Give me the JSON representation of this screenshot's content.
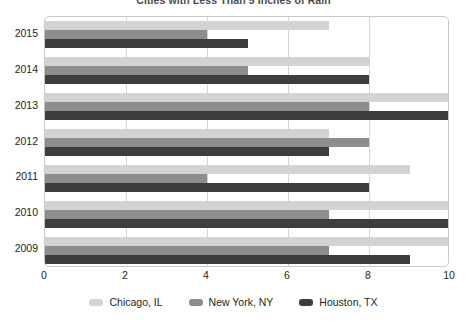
{
  "chart_data": {
    "type": "bar",
    "orientation": "horizontal",
    "title": "Cities with Less Than 5 Inches of Rain",
    "categories": [
      "2015",
      "2014",
      "2013",
      "2012",
      "2011",
      "2010",
      "2009"
    ],
    "series": [
      {
        "name": "Chicago, IL",
        "color": "#d3d3d3",
        "values": [
          7,
          8,
          10,
          7,
          9,
          10,
          10
        ]
      },
      {
        "name": "New York, NY",
        "color": "#8d8d8d",
        "values": [
          4,
          5,
          8,
          8,
          4,
          7,
          7
        ]
      },
      {
        "name": "Houston, TX",
        "color": "#3d3d3d",
        "values": [
          5,
          8,
          10,
          7,
          8,
          10,
          9
        ]
      }
    ],
    "xlabel": "",
    "ylabel": "",
    "xlim": [
      0,
      10
    ],
    "xticks": [
      0,
      2,
      4,
      6,
      8,
      10
    ],
    "xtick_labels": [
      "0",
      "2",
      "4",
      "6",
      "8",
      "10"
    ],
    "grid": true,
    "grid_axis": "x",
    "legend_position": "bottom"
  },
  "legend": {
    "items": [
      {
        "label": "Chicago, IL",
        "swatch": "chicago"
      },
      {
        "label": "New York, NY",
        "swatch": "newyork"
      },
      {
        "label": "Houston, TX",
        "swatch": "houston"
      }
    ]
  }
}
